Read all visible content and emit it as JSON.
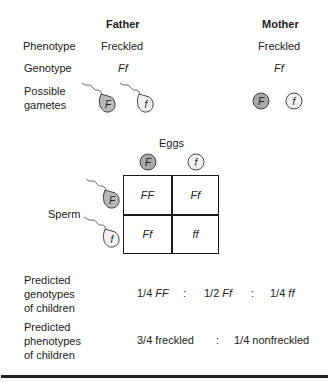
{
  "header": {
    "father": "Father",
    "mother": "Mother"
  },
  "rows": {
    "phenotype": {
      "label": "Phenotype",
      "father": "Freckled",
      "mother": "Freckled"
    },
    "genotype": {
      "label": "Genotype",
      "father": "Ff",
      "mother": "Ff"
    },
    "gametes": {
      "label_line1": "Possible",
      "label_line2": "gametes"
    }
  },
  "father_gametes": [
    {
      "allele": "F",
      "type": "sperm",
      "fill": "#b8b8b8"
    },
    {
      "allele": "f",
      "type": "sperm",
      "fill": "#f2f2f2"
    }
  ],
  "mother_gametes": [
    {
      "allele": "F",
      "type": "egg",
      "fill": "#a8a8a8"
    },
    {
      "allele": "f",
      "type": "egg",
      "fill": "#f2f2f2"
    }
  ],
  "punnett": {
    "eggs_label": "Eggs",
    "sperm_label": "Sperm",
    "egg_alleles": [
      "F",
      "f"
    ],
    "sperm_alleles": [
      "F",
      "f"
    ],
    "cells": [
      [
        "FF",
        "Ff"
      ],
      [
        "Ff",
        "ff"
      ]
    ]
  },
  "predicted_genotypes": {
    "label_lines": [
      "Predicted",
      "genotypes",
      "of children"
    ],
    "items": [
      {
        "fraction": "1/4",
        "genotype": "FF"
      },
      {
        "fraction": "1/2",
        "genotype": "Ff"
      },
      {
        "fraction": "1/4",
        "genotype": "ff"
      }
    ],
    "separator": ":"
  },
  "predicted_phenotypes": {
    "label_lines": [
      "Predicted",
      "phenotypes",
      "of children"
    ],
    "items": [
      "3/4 freckled",
      "1/4 nonfreckled"
    ],
    "separator": ":"
  },
  "colors": {
    "dominant_fill": "#b0b0b0",
    "recessive_fill": "#f2f2f2",
    "stroke": "#333333"
  }
}
